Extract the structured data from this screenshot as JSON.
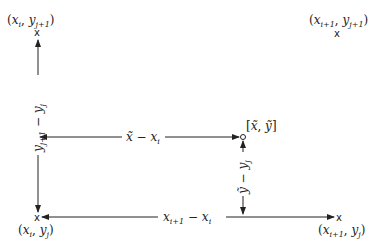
{
  "diagram": {
    "corners": [
      {
        "id": "top-left",
        "marker": "x",
        "label": "(x_i, y_{j+1})",
        "var1": "x",
        "sub1": "i",
        "var2": "y",
        "sub2": "j+1"
      },
      {
        "id": "top-right",
        "marker": "x",
        "label": "(x_{i+1}, y_{j+1})",
        "var1": "x",
        "sub1": "i+1",
        "var2": "y",
        "sub2": "j+1"
      },
      {
        "id": "bottom-left",
        "marker": "x",
        "label": "(x_i, y_j)",
        "var1": "x",
        "sub1": "i",
        "var2": "y",
        "sub2": "j"
      },
      {
        "id": "bottom-right",
        "marker": "x",
        "label": "(x_{i+1}, y_j)",
        "var1": "x",
        "sub1": "i+1",
        "var2": "y",
        "sub2": "j"
      }
    ],
    "point": {
      "marker": "o",
      "label": "[x̃, ỹ]",
      "x": "x̃",
      "y": "ỹ"
    },
    "arrows": [
      {
        "id": "left-vertical",
        "label": "y_{j+1} − y_j",
        "a": "y",
        "a_sub": "j+1",
        "op": "−",
        "b": "y",
        "b_sub": "j"
      },
      {
        "id": "middle-horizontal",
        "label": "x̃ − x_i",
        "a": "x̃",
        "op": "−",
        "b": "x",
        "b_sub": "i"
      },
      {
        "id": "right-vertical",
        "label": "ỹ − y_j",
        "a": "ỹ",
        "op": "−",
        "b": "y",
        "b_sub": "j"
      },
      {
        "id": "bottom-horizontal",
        "label": "x_{i+1} − x_i",
        "a": "x",
        "a_sub": "i+1",
        "op": "−",
        "b": "x",
        "b_sub": "i"
      }
    ],
    "colors": {
      "line": "#222222",
      "background": "#ffffff"
    }
  }
}
